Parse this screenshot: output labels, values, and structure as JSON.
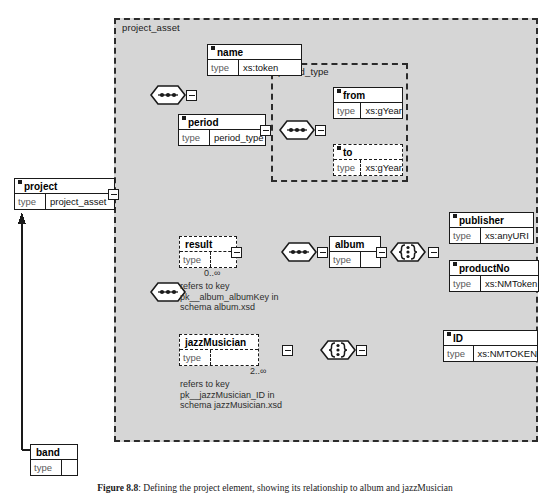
{
  "diagram": {
    "groups": [
      {
        "name": "project_asset_group",
        "label": "project_asset"
      },
      {
        "name": "period_type_group",
        "label": "period_type"
      }
    ],
    "nodes": {
      "project": {
        "name": "project",
        "key": "type",
        "value": "project_asset",
        "optional": false
      },
      "band": {
        "name": "band",
        "key": "type",
        "value": "",
        "optional": false
      },
      "name": {
        "name": "name",
        "key": "type",
        "value": "xs:token",
        "optional": false
      },
      "period": {
        "name": "period",
        "key": "type",
        "value": "period_type",
        "optional": false
      },
      "from": {
        "name": "from",
        "key": "type",
        "value": "xs:gYear",
        "optional": false
      },
      "to": {
        "name": "to",
        "key": "type",
        "value": "xs:gYear",
        "optional": true
      },
      "result": {
        "name": "result",
        "key": "type",
        "value": "",
        "optional": true
      },
      "album": {
        "name": "album",
        "key": "type",
        "value": "",
        "optional": false
      },
      "publisher": {
        "name": "publisher",
        "key": "type",
        "value": "xs:anyURI",
        "optional": false
      },
      "productNo": {
        "name": "productNo",
        "key": "type",
        "value": "xs:NMToken",
        "optional": false
      },
      "jazzMusician": {
        "name": "jazzMusician",
        "key": "type",
        "value": "",
        "optional": true
      },
      "id": {
        "name": "ID",
        "key": "type",
        "value": "xs:NMTOKEN",
        "optional": false
      }
    },
    "compositors": [
      {
        "name": "sequence-project-asset",
        "kind": "sequence"
      },
      {
        "name": "sequence-period-type",
        "kind": "sequence"
      },
      {
        "name": "sequence-album",
        "kind": "sequence"
      },
      {
        "name": "all-album-children",
        "kind": "all"
      },
      {
        "name": "all-jazzmusician-id",
        "kind": "all"
      }
    ],
    "annotations": {
      "result_occurs": "0..∞",
      "result_note": [
        "refers to key",
        "pk__album_albumKey in",
        "schema album.xsd"
      ],
      "jazzmusician_occurs": "2..∞",
      "jazzmusician_note": [
        "refers to key",
        "pk__jazzMusician_ID in",
        "schema jazzMusician.xsd"
      ]
    },
    "caption": {
      "figure_number": "Figure 8.8",
      "text": ": Defining the project element, showing its relationship to album and jazzMusician"
    },
    "colors": {
      "group_fill": "#d6d6d6",
      "line": "#1a1a1a",
      "node_fill": "#ffffff",
      "label_muted": "#5a5a5a"
    }
  }
}
